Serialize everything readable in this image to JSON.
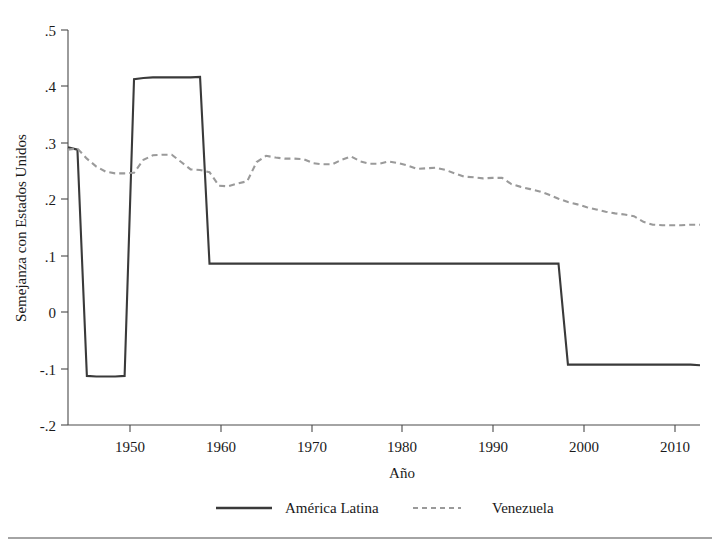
{
  "chart_data": {
    "type": "line",
    "title": "",
    "xlabel": "Año",
    "ylabel": "Semejanza con Estados Unidos",
    "xlim": [
      1946,
      2013
    ],
    "ylim": [
      -0.2,
      0.5
    ],
    "xticks": [
      1950,
      1960,
      1970,
      1980,
      1990,
      2000,
      2010
    ],
    "xtick_labels": [
      "1950",
      "1960",
      "1970",
      "1980",
      "1990",
      "2000",
      "2010"
    ],
    "yticks": [
      -0.2,
      -0.1,
      0,
      0.1,
      0.2,
      0.3,
      0.4,
      0.5
    ],
    "ytick_labels": [
      "-.2",
      "-.1",
      "0",
      ".1",
      ".2",
      ".3",
      ".4",
      ".5"
    ],
    "grid": false,
    "legend_position": "bottom",
    "series": [
      {
        "name": "América Latina",
        "style": "solid",
        "color": "#3a3a3a",
        "x": [
          1946,
          1947,
          1948,
          1949,
          1950,
          1951,
          1952,
          1953,
          1954,
          1955,
          1956,
          1957,
          1958,
          1959,
          1960,
          1961,
          1962,
          1963,
          1964,
          1965,
          1966,
          1967,
          1968,
          1969,
          1970,
          1971,
          1972,
          1973,
          1974,
          1975,
          1976,
          1977,
          1978,
          1979,
          1980,
          1981,
          1982,
          1983,
          1984,
          1985,
          1986,
          1987,
          1988,
          1989,
          1990,
          1991,
          1992,
          1993,
          1994,
          1995,
          1996,
          1997,
          1998,
          1999,
          2000,
          2001,
          2002,
          2003,
          2004,
          2005,
          2006,
          2007,
          2008,
          2009,
          2010,
          2011,
          2012,
          2013
        ],
        "values": [
          0.292,
          0.288,
          -0.113,
          -0.114,
          -0.114,
          -0.114,
          -0.113,
          0.413,
          0.415,
          0.416,
          0.416,
          0.416,
          0.416,
          0.416,
          0.417,
          0.086,
          0.086,
          0.086,
          0.086,
          0.086,
          0.086,
          0.086,
          0.086,
          0.086,
          0.086,
          0.086,
          0.086,
          0.086,
          0.086,
          0.086,
          0.086,
          0.086,
          0.086,
          0.086,
          0.086,
          0.086,
          0.086,
          0.086,
          0.086,
          0.086,
          0.086,
          0.086,
          0.086,
          0.086,
          0.086,
          0.086,
          0.086,
          0.086,
          0.086,
          0.086,
          0.086,
          0.086,
          0.086,
          -0.093,
          -0.093,
          -0.093,
          -0.093,
          -0.093,
          -0.093,
          -0.093,
          -0.093,
          -0.093,
          -0.093,
          -0.093,
          -0.093,
          -0.093,
          -0.093,
          -0.094
        ]
      },
      {
        "name": "Venezuela",
        "style": "dashed",
        "color": "#9a9a9a",
        "x": [
          1946,
          1947,
          1948,
          1949,
          1950,
          1951,
          1952,
          1953,
          1954,
          1955,
          1956,
          1957,
          1958,
          1959,
          1960,
          1961,
          1962,
          1963,
          1964,
          1965,
          1966,
          1967,
          1968,
          1969,
          1970,
          1971,
          1972,
          1973,
          1974,
          1975,
          1976,
          1977,
          1978,
          1979,
          1980,
          1981,
          1982,
          1983,
          1984,
          1985,
          1986,
          1987,
          1988,
          1989,
          1990,
          1991,
          1992,
          1993,
          1994,
          1995,
          1996,
          1997,
          1998,
          1999,
          2000,
          2001,
          2002,
          2003,
          2004,
          2005,
          2006,
          2007,
          2008,
          2009,
          2010,
          2011,
          2012,
          2013
        ],
        "values": [
          0.288,
          0.29,
          0.272,
          0.258,
          0.249,
          0.246,
          0.246,
          0.247,
          0.27,
          0.278,
          0.279,
          0.279,
          0.266,
          0.253,
          0.252,
          0.248,
          0.224,
          0.223,
          0.228,
          0.232,
          0.266,
          0.277,
          0.274,
          0.272,
          0.272,
          0.271,
          0.264,
          0.262,
          0.262,
          0.27,
          0.276,
          0.267,
          0.263,
          0.263,
          0.267,
          0.264,
          0.26,
          0.254,
          0.255,
          0.256,
          0.252,
          0.246,
          0.24,
          0.239,
          0.237,
          0.238,
          0.238,
          0.227,
          0.222,
          0.218,
          0.214,
          0.208,
          0.201,
          0.195,
          0.191,
          0.186,
          0.182,
          0.178,
          0.175,
          0.173,
          0.17,
          0.16,
          0.155,
          0.154,
          0.154,
          0.154,
          0.155,
          0.155
        ]
      }
    ],
    "legend": [
      {
        "label": "América Latina",
        "style": "solid"
      },
      {
        "label": "Venezuela",
        "style": "dashed"
      }
    ]
  }
}
